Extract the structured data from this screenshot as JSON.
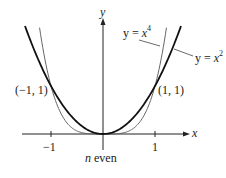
{
  "figure": {
    "caption_var": "n",
    "caption_text": " even",
    "axes": {
      "x_label": "x",
      "y_label": "y",
      "ticks": [
        {
          "value": -1,
          "label": "−1"
        },
        {
          "value": 1,
          "label": "1"
        }
      ]
    },
    "points": [
      {
        "x": -1,
        "y": 1,
        "label": "(−1, 1)"
      },
      {
        "x": 1,
        "y": 1,
        "label": "(1, 1)"
      }
    ],
    "curves": [
      {
        "name": "y = x^4",
        "eq_lhs": "y = ",
        "eq_var": "x",
        "eq_exp": "4",
        "color": "#555555",
        "weight": "thin"
      },
      {
        "name": "y = x^2",
        "eq_lhs": "y = ",
        "eq_var": "x",
        "eq_exp": "2",
        "color": "#111111",
        "weight": "bold"
      }
    ]
  },
  "chart_data": {
    "type": "line",
    "title": "",
    "caption": "n even",
    "xlabel": "x",
    "ylabel": "y",
    "xlim": [
      -1.55,
      1.7
    ],
    "ylim": [
      0,
      2.4
    ],
    "xticks": [
      -1,
      1
    ],
    "grid": false,
    "series": [
      {
        "name": "y = x^2",
        "function": "x^2",
        "x": [
          -1.5,
          -1,
          -0.5,
          0,
          0.5,
          1,
          1.5
        ],
        "values": [
          2.25,
          1,
          0.25,
          0,
          0.25,
          1,
          2.25
        ]
      },
      {
        "name": "y = x^4",
        "function": "x^4",
        "x": [
          -1.22,
          -1,
          -0.5,
          0,
          0.5,
          1,
          1.22
        ],
        "values": [
          2.22,
          1,
          0.0625,
          0,
          0.0625,
          1,
          2.22
        ]
      }
    ],
    "annotations": [
      "(-1, 1)",
      "(1, 1)",
      "y = x^4",
      "y = x^2"
    ]
  }
}
